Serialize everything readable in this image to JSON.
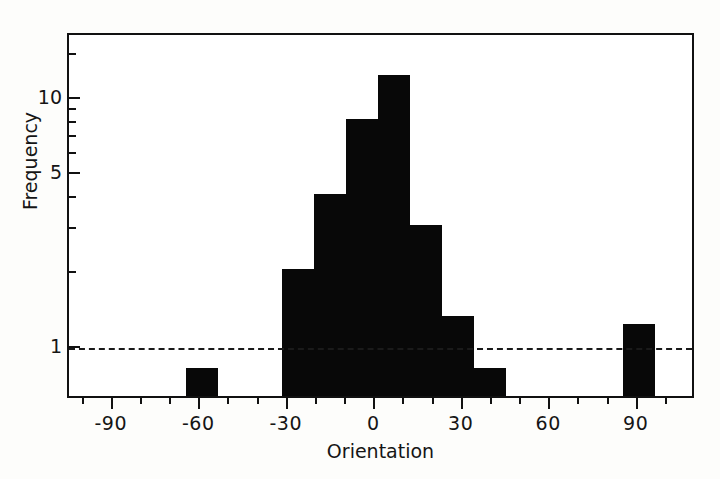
{
  "chart_data": {
    "type": "bar",
    "title": "",
    "subtitle": "",
    "xlabel": "Orientation",
    "ylabel": "Frequency",
    "yscale": "log",
    "xlim": [
      -105,
      110
    ],
    "ylim": [
      0.62,
      18
    ],
    "grid": false,
    "legend": null,
    "bin_width": 11,
    "xticklabels": [
      "-90",
      "-60",
      "-30",
      "0",
      "30",
      "60",
      "90"
    ],
    "xtickvalues": [
      -90,
      -60,
      -30,
      0,
      30,
      60,
      90
    ],
    "xminor_step": 10,
    "yticklabels": [
      "10",
      "5",
      "1"
    ],
    "ytickvalues": [
      10,
      5,
      1
    ],
    "yminor_ticks": [
      2,
      3,
      4,
      6,
      7,
      8,
      9,
      15
    ],
    "annotations": [
      {
        "name": "reference-line",
        "style": "dashed",
        "y": 1,
        "orientation": "horizontal"
      }
    ],
    "bars": [
      {
        "x_left": -65,
        "x_right": -54,
        "center": -59.5,
        "value": 0.8
      },
      {
        "x_left": -32,
        "x_right": -21,
        "center": -26.5,
        "value": 2.0
      },
      {
        "x_left": -21,
        "x_right": -10,
        "center": -15.5,
        "value": 4.0
      },
      {
        "x_left": -10,
        "x_right": 1,
        "center": -4.5,
        "value": 8.0
      },
      {
        "x_left": 1,
        "x_right": 12,
        "center": 6.5,
        "value": 12.0
      },
      {
        "x_left": 12,
        "x_right": 23,
        "center": 17.5,
        "value": 3.0
      },
      {
        "x_left": 23,
        "x_right": 34,
        "center": 28.5,
        "value": 1.3
      },
      {
        "x_left": 34,
        "x_right": 45,
        "center": 39.5,
        "value": 0.8
      },
      {
        "x_left": 85,
        "x_right": 96,
        "center": 90.5,
        "value": 1.2
      }
    ],
    "colors": {
      "bar_fill": "#080808",
      "axis": "#111111",
      "background": "#ffffff",
      "text": "#151515",
      "reference_line": "#1a1a1a"
    }
  }
}
